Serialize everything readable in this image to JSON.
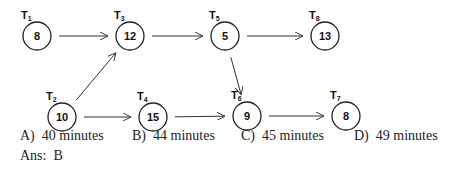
{
  "diagram": {
    "nodes": [
      {
        "id": "T1",
        "label": "T",
        "sub": "1",
        "value": "8",
        "cx": 37,
        "cy": 36
      },
      {
        "id": "T3",
        "label": "T",
        "sub": "3",
        "value": "12",
        "cx": 130,
        "cy": 36
      },
      {
        "id": "T5",
        "label": "T",
        "sub": "5",
        "value": "5",
        "cx": 225,
        "cy": 36
      },
      {
        "id": "T8",
        "label": "T",
        "sub": "8",
        "value": "13",
        "cx": 325,
        "cy": 36
      },
      {
        "id": "T2",
        "label": "T",
        "sub": "2",
        "value": "10",
        "cx": 62,
        "cy": 117
      },
      {
        "id": "T4",
        "label": "T",
        "sub": "4",
        "value": "15",
        "cx": 153,
        "cy": 117
      },
      {
        "id": "T6",
        "label": "T",
        "sub": "6",
        "value": "9",
        "cx": 247,
        "cy": 116
      },
      {
        "id": "T7",
        "label": "T",
        "sub": "7",
        "value": "8",
        "cx": 346,
        "cy": 116
      }
    ],
    "edges": [
      {
        "from": "T1",
        "to": "T3"
      },
      {
        "from": "T3",
        "to": "T5"
      },
      {
        "from": "T5",
        "to": "T8"
      },
      {
        "from": "T2",
        "to": "T3"
      },
      {
        "from": "T2",
        "to": "T4"
      },
      {
        "from": "T4",
        "to": "T6"
      },
      {
        "from": "T5",
        "to": "T6"
      },
      {
        "from": "T6",
        "to": "T7"
      }
    ]
  },
  "options": [
    {
      "letter": "A)",
      "text": "40 minutes"
    },
    {
      "letter": "B)",
      "text": "44 minutes"
    },
    {
      "letter": "C)",
      "text": "45 minutes"
    },
    {
      "letter": "D)",
      "text": "49 minutes"
    }
  ],
  "answer": {
    "label": "Ans:",
    "value": "B"
  }
}
